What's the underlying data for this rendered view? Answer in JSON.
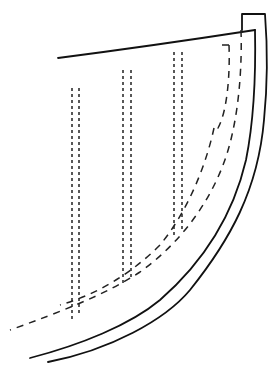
{
  "diagram": {
    "title": "",
    "colors": {
      "stroke": "#111111",
      "background": "#ffffff"
    },
    "solid_lines": [
      {
        "name": "sheer-line",
        "d": "M58,58 C120,50 190,40 255,30"
      },
      {
        "name": "stem-post-top",
        "d": "M242,30 L242,14 L265,14 C267,40 268,80 264,120 C258,190 230,240 190,290 C165,320 110,350 48,362"
      },
      {
        "name": "stem-inner-curve",
        "d": "M255,30 C256,80 254,120 246,160 C232,220 200,265 160,300 C130,325 80,345 30,358"
      }
    ],
    "dashed_curves": [
      {
        "name": "rabbet-line-outer",
        "d": "M241,30 C242,60 240,100 232,135 C220,190 185,240 140,272 C105,295 60,312 10,330"
      },
      {
        "name": "rabbet-line-inner",
        "d": "M229,45 L218,45 M229,45 C230,70 228,110 218,128 L214,128"
      },
      {
        "name": "bearding-line",
        "d": "M214,128 C205,170 185,215 160,245 C130,275 95,295 60,305"
      }
    ],
    "vertical_dashed_pairs": [
      {
        "name": "frame-1",
        "x1": 72,
        "x2": 79,
        "y_top": 88,
        "y_bottom": 322
      },
      {
        "name": "frame-2",
        "x1": 123,
        "x2": 131,
        "y_top": 70,
        "y_bottom": 285
      },
      {
        "name": "frame-3",
        "x1": 174,
        "x2": 182,
        "y_top": 52,
        "y_bottom": 236
      }
    ]
  }
}
